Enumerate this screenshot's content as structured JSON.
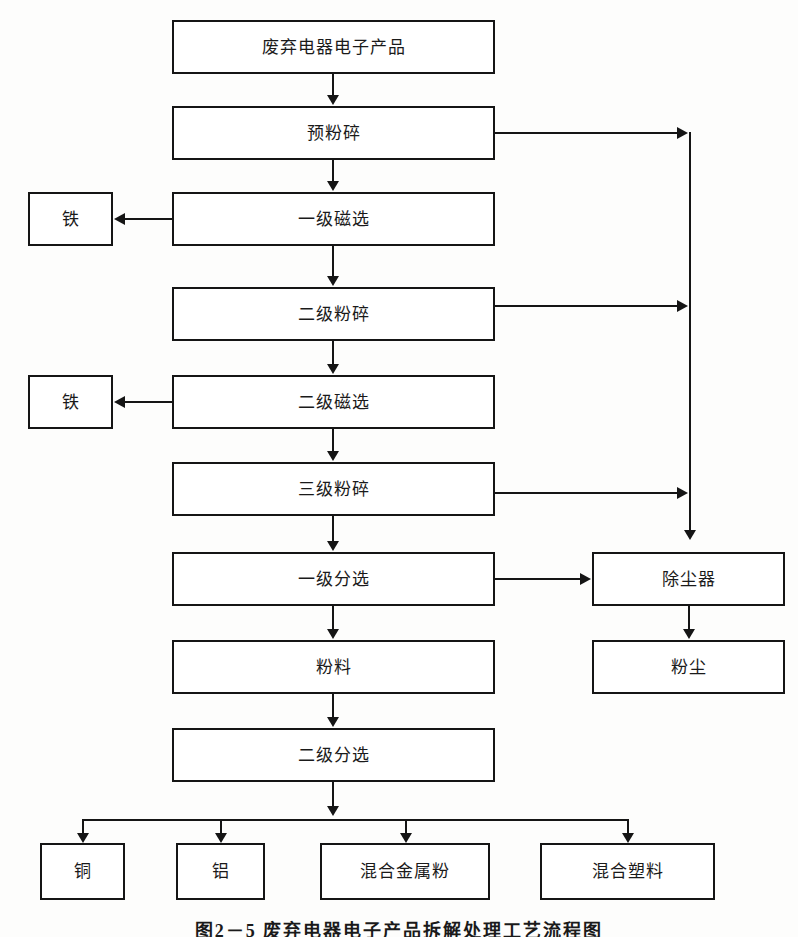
{
  "diagram": {
    "caption": "图2－5   废弃电器电子产品拆解处理工艺流程图",
    "line_color": "#151515",
    "background": "#fdfdfc",
    "nodes": {
      "input": "废弃电器电子产品",
      "pre_crush": "预粉碎",
      "magnetic_1": "一级磁选",
      "iron_1": "铁",
      "crush_2": "二级粉碎",
      "magnetic_2": "二级磁选",
      "iron_2": "铁",
      "crush_3": "三级粉碎",
      "sort_1": "一级分选",
      "powder_material": "粉料",
      "sort_2": "二级分选",
      "dust_collector": "除尘器",
      "dust": "粉尘",
      "copper": "铜",
      "aluminum": "铝",
      "mixed_metal_powder": "混合金属粉",
      "mixed_plastic": "混合塑料"
    },
    "flow": {
      "main_chain": [
        "废弃电器电子产品",
        "预粉碎",
        "一级磁选",
        "二级粉碎",
        "二级磁选",
        "三级粉碎",
        "一级分选",
        "粉料",
        "二级分选"
      ],
      "side_outputs": [
        {
          "from": "一级磁选",
          "to": "铁",
          "direction": "left"
        },
        {
          "from": "二级磁选",
          "to": "铁",
          "direction": "left"
        },
        {
          "from": "预粉碎",
          "to": "除尘器",
          "direction": "right"
        },
        {
          "from": "二级粉碎",
          "to": "除尘器",
          "direction": "right"
        },
        {
          "from": "三级粉碎",
          "to": "除尘器",
          "direction": "right"
        },
        {
          "from": "一级分选",
          "to": "除尘器",
          "direction": "right"
        },
        {
          "from": "除尘器",
          "to": "粉尘",
          "direction": "down"
        }
      ],
      "final_products": [
        "铜",
        "铝",
        "混合金属粉",
        "混合塑料"
      ]
    }
  }
}
